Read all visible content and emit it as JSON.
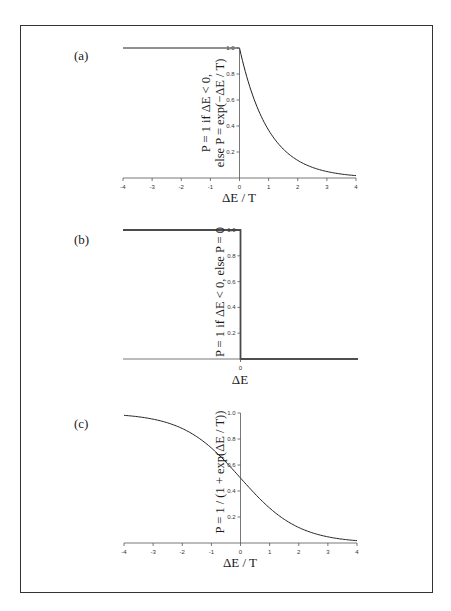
{
  "figure": {
    "panels": [
      {
        "id": "a",
        "label": "(a)",
        "xlabel": "ΔE / T",
        "ylabel_line1": "P = 1 if ΔE < 0,",
        "ylabel_line2": "else P = exp(−ΔE / T)"
      },
      {
        "id": "b",
        "label": "(b)",
        "xlabel": "ΔE",
        "ylabel_line1": "P = 1 if ΔE < 0, else P = 0",
        "ylabel_line2": ""
      },
      {
        "id": "c",
        "label": "(c)",
        "xlabel": "ΔE / T",
        "ylabel_line1": "P = 1 / (1 + exp(ΔE / T))",
        "ylabel_line2": ""
      }
    ],
    "x_ticks": [
      "-4",
      "-3",
      "-2",
      "-1",
      "0",
      "1",
      "2",
      "3",
      "4"
    ],
    "y_ticks": [
      "0.2",
      "0.4",
      "0.6",
      "0.8",
      "1.0"
    ],
    "b_x_ticks": [
      "0"
    ]
  },
  "chart_data": [
    {
      "type": "line",
      "panel": "(a)",
      "title": "",
      "xlabel": "ΔE / T",
      "ylabel": "P = 1 if ΔE < 0, else P = exp(−ΔE / T)",
      "xlim": [
        -4,
        4
      ],
      "ylim": [
        0,
        1
      ],
      "x_ticks": [
        -4,
        -3,
        -2,
        -1,
        0,
        1,
        2,
        3,
        4
      ],
      "y_ticks": [
        0.2,
        0.4,
        0.6,
        0.8,
        1.0
      ],
      "grid": false,
      "series": [
        {
          "name": "P",
          "x": [
            -4,
            -2,
            0,
            0.5,
            1,
            1.5,
            2,
            2.5,
            3,
            3.5,
            4
          ],
          "values": [
            1,
            1,
            1,
            0.61,
            0.37,
            0.22,
            0.14,
            0.08,
            0.05,
            0.03,
            0.02
          ]
        }
      ]
    },
    {
      "type": "line",
      "panel": "(b)",
      "title": "",
      "xlabel": "ΔE",
      "ylabel": "P = 1 if ΔE < 0, else P = 0",
      "ylim": [
        0,
        1
      ],
      "x_ticks": [
        0
      ],
      "y_ticks": [
        0.2,
        0.4,
        0.6,
        0.8,
        1.0
      ],
      "grid": false,
      "series": [
        {
          "name": "P",
          "x": [
            "<0",
            "0",
            ">0"
          ],
          "values": [
            1,
            1,
            0
          ]
        }
      ]
    },
    {
      "type": "line",
      "panel": "(c)",
      "title": "",
      "xlabel": "ΔE / T",
      "ylabel": "P = 1 / (1 + exp(ΔE / T))",
      "xlim": [
        -4,
        4
      ],
      "ylim": [
        0,
        1
      ],
      "x_ticks": [
        -4,
        -3,
        -2,
        -1,
        0,
        1,
        2,
        3,
        4
      ],
      "y_ticks": [
        0.2,
        0.4,
        0.6,
        0.8,
        1.0
      ],
      "grid": false,
      "series": [
        {
          "name": "P",
          "x": [
            -4,
            -3,
            -2,
            -1,
            0,
            1,
            2,
            3,
            4
          ],
          "values": [
            0.98,
            0.95,
            0.88,
            0.73,
            0.5,
            0.27,
            0.12,
            0.05,
            0.02
          ]
        }
      ]
    }
  ]
}
